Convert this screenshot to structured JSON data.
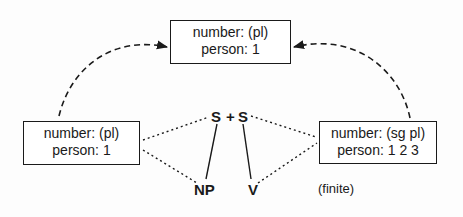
{
  "diagram": {
    "top_box": {
      "line1": "number: (pl)",
      "line2": "person: 1"
    },
    "left_box": {
      "line1": "number: (pl)",
      "line2": "person: 1"
    },
    "right_box": {
      "line1": "number: (sg pl)",
      "line2": "person: 1 2 3"
    },
    "nodes": {
      "s_left": "S",
      "plus": "+",
      "s_right": "S",
      "np": "NP",
      "v": "V"
    },
    "annotation": "(finite)",
    "colors": {
      "ink": "#1a1a1a",
      "background": "#fdfdfd"
    }
  }
}
